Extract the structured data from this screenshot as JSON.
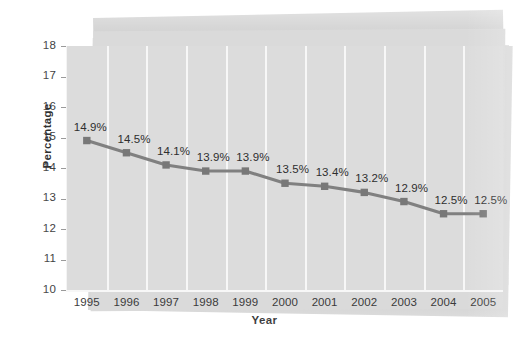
{
  "chart_data": {
    "type": "line",
    "title": "",
    "subtitle": "",
    "xlabel": "Year",
    "ylabel": "Percentage",
    "categories": [
      "1995",
      "1996",
      "1997",
      "1998",
      "1999",
      "2000",
      "2001",
      "2002",
      "2003",
      "2004",
      "2005"
    ],
    "values": [
      14.9,
      14.5,
      14.1,
      13.9,
      13.9,
      13.5,
      13.4,
      13.2,
      12.9,
      12.5,
      12.5
    ],
    "point_labels": [
      "14.9%",
      "14.5%",
      "14.1%",
      "13.9%",
      "13.9%",
      "13.5%",
      "13.4%",
      "13.2%",
      "12.9%",
      "12.5%",
      "12.5%"
    ],
    "ylim": [
      10,
      18
    ],
    "yticks": [
      18,
      17,
      16,
      15,
      14,
      13,
      12,
      11,
      10
    ],
    "ytick_labels": [
      "18",
      "17",
      "16",
      "15",
      "14",
      "13",
      "12",
      "11",
      "10"
    ],
    "grid": "vertical-only",
    "legend": "none",
    "series": [
      {
        "name": "Percentage",
        "values": [
          14.9,
          14.5,
          14.1,
          13.9,
          13.9,
          13.5,
          13.4,
          13.2,
          12.9,
          12.5,
          12.5
        ]
      }
    ],
    "marker": "square",
    "colors": {
      "line": "#808080",
      "marker": "#787878",
      "plot_background": "#dcdcdc",
      "panel_background": "#d8d8d8",
      "gridline": "#f7f7f7",
      "tick_label": "#3b3b3b",
      "axis_title": "#1f1f1f",
      "point_label": "#2e2e2e"
    }
  }
}
